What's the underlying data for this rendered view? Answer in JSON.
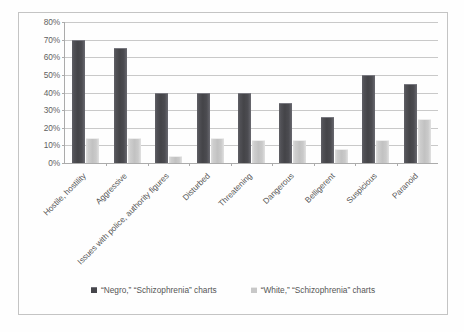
{
  "chart_data": {
    "type": "bar",
    "title": "",
    "subtitle": "",
    "xlabel": "",
    "ylabel": "",
    "ylim": [
      0,
      80
    ],
    "ytick_step": 10,
    "ytick_labels": [
      "80%",
      "70%",
      "60%",
      "50%",
      "40%",
      "30%",
      "20%",
      "10%",
      "0%"
    ],
    "ytick_values": [
      80,
      70,
      60,
      50,
      40,
      30,
      20,
      10,
      0
    ],
    "grid": true,
    "legend_position": "bottom",
    "categories": [
      "Hostile, hostility",
      "Aggressive",
      "Issues with police, authority figures",
      "Disturbed",
      "Threatening",
      "Dangerous",
      "Belligerent",
      "Suspicious",
      "Paranoid"
    ],
    "series": [
      {
        "name": "“Negro,” “Schizophrenia” charts",
        "color": "#1f1f25",
        "values": [
          70,
          65,
          40,
          40,
          40,
          34,
          26,
          50,
          45
        ]
      },
      {
        "name": "“White,” “Schizophrenia” charts",
        "color": "#bdbdbd",
        "values": [
          14,
          14,
          4,
          14,
          13,
          13,
          8,
          13,
          25
        ]
      }
    ]
  },
  "legend": {
    "items": [
      {
        "label": "“Negro,” “Schizophrenia” charts",
        "marker": "square-dark-icon"
      },
      {
        "label": "“White,” “Schizophrenia” charts",
        "marker": "square-light-icon"
      }
    ]
  }
}
